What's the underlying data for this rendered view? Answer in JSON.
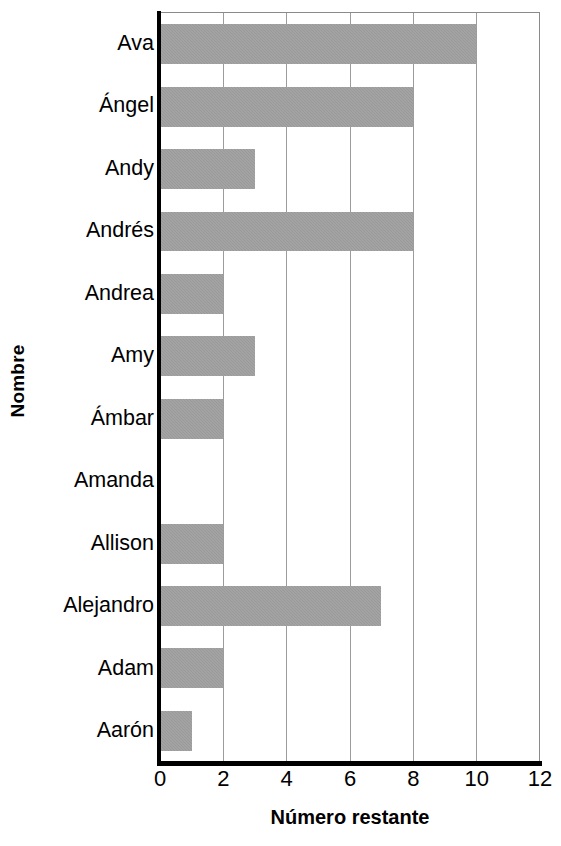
{
  "chart_data": {
    "type": "bar",
    "orientation": "horizontal",
    "title": "",
    "xlabel": "Número restante",
    "ylabel": "Nombre",
    "categories": [
      "Ava",
      "Ángel",
      "Andy",
      "Andrés",
      "Andrea",
      "Amy",
      "Ámbar",
      "Amanda",
      "Allison",
      "Alejandro",
      "Adam",
      "Aarón"
    ],
    "values": [
      10,
      8,
      3,
      8,
      2,
      3,
      2,
      0,
      2,
      7,
      2,
      1
    ],
    "xlim": [
      0,
      12
    ],
    "xticks": [
      0,
      2,
      4,
      6,
      8,
      10,
      12
    ],
    "xtick_labels": [
      "0",
      "2",
      "4",
      "6",
      "8",
      "10",
      "12"
    ],
    "grid": "vertical",
    "legend": "none",
    "bar_color": "#999999",
    "axis_color": "#000000",
    "gridline_color": "#9c9c9c",
    "background_color": "#ffffff"
  }
}
